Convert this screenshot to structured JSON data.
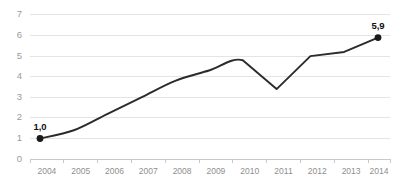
{
  "chart_data": {
    "type": "line",
    "title": "",
    "xlabel": "",
    "ylabel": "",
    "categories": [
      "2004",
      "2005",
      "2006",
      "2007",
      "2008",
      "2009",
      "2010",
      "2011",
      "2012",
      "2013",
      "2014"
    ],
    "values": [
      1.0,
      1.4,
      2.2,
      3.0,
      3.8,
      4.3,
      4.8,
      3.4,
      5.0,
      5.2,
      5.9
    ],
    "series": [
      {
        "name": "",
        "values": [
          1.0,
          1.4,
          2.2,
          3.0,
          3.8,
          4.3,
          4.8,
          3.4,
          5.0,
          5.2,
          5.9
        ]
      }
    ],
    "ylim": [
      0,
      7
    ],
    "yticks": [
      "0",
      "1",
      "2",
      "3",
      "4",
      "5",
      "6",
      "7"
    ],
    "xticks": [
      "2004",
      "2005",
      "2006",
      "2007",
      "2008",
      "2009",
      "2010",
      "2011",
      "2012",
      "2013",
      "2014"
    ],
    "grid": true,
    "legend": false,
    "annotations": [
      {
        "label": "1,0",
        "x": "2004",
        "y": 1.0
      },
      {
        "label": "5,9",
        "x": "2014",
        "y": 5.9
      }
    ],
    "colors": {
      "line": "#2b2b2b",
      "marker": "#1a1a1a",
      "gridline": "#e4e4e4",
      "axis": "#c9c9c9",
      "tick_label": "#9a9a9a",
      "data_label": "#111111",
      "background": "#ffffff"
    }
  }
}
